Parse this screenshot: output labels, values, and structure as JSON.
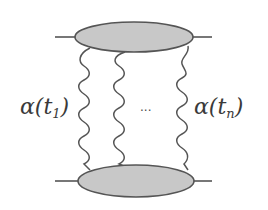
{
  "diagram": {
    "type": "feynman-ladder",
    "colors": {
      "line": "#555555",
      "blob_fill": "#c8c8c8",
      "background": "#ffffff"
    },
    "labels": {
      "left_alpha": "α(t",
      "left_sub": "1",
      "left_close": ")",
      "right_alpha": "α(t",
      "right_sub": "n",
      "right_close": ")",
      "ellipsis": "..."
    },
    "blobs": [
      "top-vertex",
      "bottom-vertex"
    ],
    "exchanges": [
      "exchange-1",
      "exchange-2",
      "exchange-n"
    ]
  }
}
